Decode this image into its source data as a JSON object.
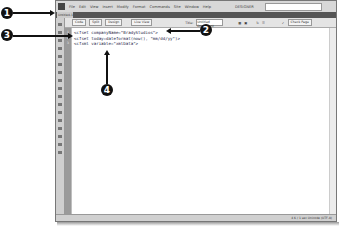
{
  "menubar": {
    "items": [
      "File",
      "Edit",
      "View",
      "Insert",
      "Modify",
      "Format",
      "Commands",
      "Site",
      "Window",
      "Help"
    ],
    "workspace": "DESIGNER"
  },
  "document_tab": {
    "label": "Untitled-1",
    "path": ""
  },
  "toolbar": {
    "code_label": "Code",
    "split_label": "Split",
    "design_label": "Design",
    "live_view_label": "Live View",
    "title_label": "Title:",
    "title_value": "Untitled Document",
    "check_page_label": "Check Page"
  },
  "code_lines": [
    {
      "num": "1",
      "text": "<cfset companyName=\"BradyStudios\">"
    },
    {
      "num": "2",
      "text": "<cfset today=dateformat(now(), \"mm/dd/yy\")>"
    },
    {
      "num": "3",
      "text": "<cfxml variable=\"xmlData\">"
    }
  ],
  "status_bar": {
    "text": "4 K / 1 sec  Unicode (UTF-8)"
  },
  "callouts": [
    {
      "number": "1"
    },
    {
      "number": "2"
    },
    {
      "number": "3"
    },
    {
      "number": "4"
    }
  ]
}
